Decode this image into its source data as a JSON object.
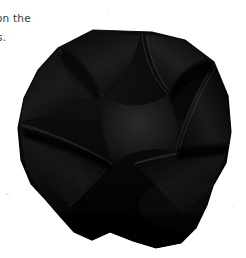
{
  "page": {
    "width": 246,
    "height": 258,
    "background_color": "#ffffff",
    "kind": "scanned-book-page-fragment"
  },
  "text_column": {
    "line_1": "on the",
    "line_2": "s.",
    "note_clipped_at_left_margin": true,
    "text_color": "#3a3a3a"
  },
  "photo": {
    "subject": "dark folded paper craft object",
    "description": "Black folded paper bowl / rosette with radiating curved petal folds forming a rounded star-like opening",
    "silhouette_shape": "rounded polygon",
    "colors": {
      "body": "#050505",
      "deep_shadow": "#000000",
      "fold_midtone": "#121212",
      "fold_highlight": "#242424",
      "crease_line": "#2e2e2e",
      "interior_floor": "#1b1b1b",
      "rim_sheen": "#1f1f1f"
    },
    "petals": 6,
    "lighting": "diffuse top-left"
  }
}
